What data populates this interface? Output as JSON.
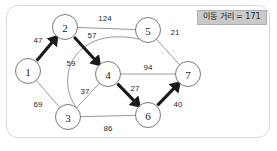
{
  "card": {
    "background_color": "#ffffff",
    "border_color": "#d9d9d9"
  },
  "badge": {
    "label": "이동 거리 = 171",
    "background_color": "#c9c9c9",
    "text_color": "#1c1c1c"
  },
  "graph": {
    "node_fill": "#ffffff",
    "node_stroke": "#6b6b6b",
    "edge_color": "#8c8c8c",
    "path_color": "#1a1a1a",
    "nodes": [
      {
        "id": "1",
        "label": "1",
        "cx": 28,
        "cy": 71,
        "r": 12.5
      },
      {
        "id": "2",
        "label": "2",
        "cx": 65,
        "cy": 27,
        "r": 12.5
      },
      {
        "id": "3",
        "label": "3",
        "cx": 68,
        "cy": 117,
        "r": 12.5
      },
      {
        "id": "4",
        "label": "4",
        "cx": 108,
        "cy": 74,
        "r": 12.5
      },
      {
        "id": "5",
        "label": "5",
        "cx": 148,
        "cy": 30,
        "r": 12.5
      },
      {
        "id": "6",
        "label": "6",
        "cx": 148,
        "cy": 115,
        "r": 12.5
      },
      {
        "id": "7",
        "label": "7",
        "cx": 188,
        "cy": 74,
        "r": 12.5
      }
    ],
    "edges": [
      {
        "from": "2",
        "to": "5",
        "weight": "124",
        "label_x": 105,
        "label_y": 18,
        "type": "line"
      },
      {
        "from": "5",
        "to": "7",
        "weight": "21",
        "label_x": 175,
        "label_y": 32,
        "type": "line"
      },
      {
        "from": "4",
        "to": "7",
        "weight": "94",
        "label_x": 148,
        "label_y": 67,
        "type": "line"
      },
      {
        "from": "3",
        "to": "6",
        "weight": "86",
        "label_x": 108,
        "label_y": 128,
        "type": "line"
      },
      {
        "from": "1",
        "to": "3",
        "weight": "69",
        "label_x": 38,
        "label_y": 104,
        "type": "line"
      },
      {
        "from": "3",
        "to": "4",
        "weight": "37",
        "label_x": 85,
        "label_y": 91,
        "type": "line"
      },
      {
        "from": "3",
        "to": "5",
        "weight": "59",
        "label_x": 71,
        "label_y": 63,
        "type": "curve"
      }
    ],
    "path_edges": [
      {
        "from": "1",
        "to": "2",
        "weight": "47",
        "label_x": 38,
        "label_y": 40
      },
      {
        "from": "2",
        "to": "4",
        "weight": "57",
        "label_x": 92,
        "label_y": 35
      },
      {
        "from": "4",
        "to": "6",
        "weight": "27",
        "label_x": 135,
        "label_y": 88
      },
      {
        "from": "6",
        "to": "7",
        "weight": "40",
        "label_x": 178,
        "label_y": 104
      }
    ],
    "path_sequence": [
      "1",
      "2",
      "4",
      "6",
      "7"
    ],
    "total_distance": "171"
  }
}
